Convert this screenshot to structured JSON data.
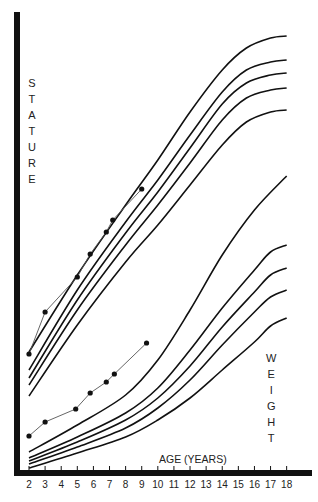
{
  "chart_data": {
    "type": "line",
    "title": "",
    "xlabel": "AGE (YEARS)",
    "ylabel_top": "STATURE",
    "ylabel_bottom": "WEIGHT",
    "x_ticks": [
      2,
      3,
      4,
      5,
      6,
      7,
      8,
      9,
      10,
      11,
      12,
      13,
      14,
      15,
      16,
      17,
      18
    ],
    "xlim": [
      2,
      18
    ],
    "grid": false,
    "legend": "none",
    "percentile_curves": {
      "stature": [
        {
          "name": "stature-curve-1",
          "points": [
            [
              2,
              352
            ],
            [
              5,
              275
            ],
            [
              8,
              205
            ],
            [
              10,
              160
            ],
            [
              12,
              112
            ],
            [
              14,
              70
            ],
            [
              15.5,
              48
            ],
            [
              17,
              38
            ],
            [
              18,
              36
            ]
          ]
        },
        {
          "name": "stature-curve-2",
          "points": [
            [
              2,
              370
            ],
            [
              5,
              290
            ],
            [
              8,
              222
            ],
            [
              10,
              180
            ],
            [
              12,
              135
            ],
            [
              14,
              92
            ],
            [
              15.5,
              70
            ],
            [
              17,
              62
            ],
            [
              18,
              60
            ]
          ]
        },
        {
          "name": "stature-curve-3",
          "points": [
            [
              2,
              378
            ],
            [
              5,
              300
            ],
            [
              8,
              233
            ],
            [
              10,
              192
            ],
            [
              12,
              148
            ],
            [
              14,
              104
            ],
            [
              15.5,
              83
            ],
            [
              17,
              75
            ],
            [
              18,
              73
            ]
          ]
        },
        {
          "name": "stature-curve-4",
          "points": [
            [
              2,
              385
            ],
            [
              5,
              310
            ],
            [
              8,
              245
            ],
            [
              10,
              205
            ],
            [
              12,
              163
            ],
            [
              14,
              120
            ],
            [
              15.5,
              98
            ],
            [
              17,
              90
            ],
            [
              18,
              88
            ]
          ]
        },
        {
          "name": "stature-curve-5",
          "points": [
            [
              2,
              396
            ],
            [
              5,
              325
            ],
            [
              8,
              262
            ],
            [
              10,
              225
            ],
            [
              12,
              185
            ],
            [
              14,
              145
            ],
            [
              15.5,
              122
            ],
            [
              17,
              112
            ],
            [
              18,
              110
            ]
          ]
        }
      ],
      "weight": [
        {
          "name": "weight-curve-1",
          "points": [
            [
              2,
              452
            ],
            [
              5,
              425
            ],
            [
              8,
              395
            ],
            [
              10,
              360
            ],
            [
              12,
              310
            ],
            [
              14,
              255
            ],
            [
              16,
              210
            ],
            [
              18,
              176
            ]
          ]
        },
        {
          "name": "weight-curve-2",
          "points": [
            [
              2,
              458
            ],
            [
              5,
              437
            ],
            [
              8,
              413
            ],
            [
              10,
              388
            ],
            [
              12,
              350
            ],
            [
              14,
              308
            ],
            [
              16,
              270
            ],
            [
              17,
              252
            ],
            [
              18,
              245
            ]
          ]
        },
        {
          "name": "weight-curve-3",
          "points": [
            [
              2,
              461
            ],
            [
              5,
              442
            ],
            [
              8,
              420
            ],
            [
              10,
              398
            ],
            [
              12,
              366
            ],
            [
              14,
              327
            ],
            [
              16,
              292
            ],
            [
              17,
              275
            ],
            [
              18,
              268
            ]
          ]
        },
        {
          "name": "weight-curve-4",
          "points": [
            [
              2,
              464
            ],
            [
              5,
              447
            ],
            [
              8,
              428
            ],
            [
              10,
              408
            ],
            [
              12,
              380
            ],
            [
              14,
              345
            ],
            [
              16,
              312
            ],
            [
              17,
              297
            ],
            [
              18,
              290
            ]
          ]
        },
        {
          "name": "weight-curve-5",
          "points": [
            [
              2,
              468
            ],
            [
              5,
              453
            ],
            [
              8,
              437
            ],
            [
              10,
              420
            ],
            [
              12,
              398
            ],
            [
              14,
              370
            ],
            [
              16,
              342
            ],
            [
              17,
              326
            ],
            [
              18,
              318
            ]
          ]
        }
      ]
    },
    "series": [
      {
        "name": "child-stature",
        "x": [
          2,
          3,
          5,
          5.8,
          6.8,
          7.2,
          9
        ],
        "pixel_y": [
          354,
          312,
          277,
          254,
          232,
          220,
          189
        ]
      },
      {
        "name": "child-weight",
        "x": [
          2,
          3,
          4.9,
          5.8,
          6.8,
          7.3,
          9.3
        ],
        "pixel_y": [
          436,
          422,
          409,
          393,
          382,
          374,
          343
        ]
      }
    ],
    "axis_pixel_map": {
      "x_at_2": 29,
      "x_at_18": 296
    }
  },
  "labels": {
    "stature": [
      "S",
      "T",
      "A",
      "T",
      "U",
      "R",
      "E"
    ],
    "weight": [
      "W",
      "E",
      "I",
      "G",
      "H",
      "T"
    ],
    "xaxis": "AGE (YEARS)",
    "ticks": [
      "2",
      "3",
      "4",
      "5",
      "6",
      "7",
      "8",
      "9",
      "10",
      "11",
      "12",
      "13",
      "14",
      "15",
      "16",
      "17",
      "18"
    ]
  },
  "colors": {
    "ink": "#111111",
    "background": "#ffffff",
    "data_line": "#555555"
  }
}
